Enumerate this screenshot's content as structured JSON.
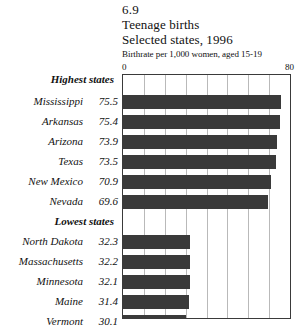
{
  "figure": {
    "number": "6.9",
    "title_line1": "Teenage births",
    "title_line2": "Selected states, 1996",
    "units_note": "Birthrate per 1,000 women, aged 15-19",
    "axis_min_label": "0",
    "axis_max_label": "80",
    "bar_color": "#3a3a3a",
    "gridline_color": "#b9b9b9",
    "frame_color": "#3a3a3a",
    "background_color": "#ffffff"
  },
  "groups": [
    {
      "heading": "Highest states"
    },
    {
      "heading": "Lowest states"
    }
  ],
  "chart_data": {
    "type": "bar",
    "orientation": "horizontal",
    "title": "Teenage births",
    "subtitle": "Selected states, 1996",
    "figure_number": "6.9",
    "xlabel": "Birthrate per 1,000 women, aged 15-19",
    "ylabel": "",
    "xlim": [
      0,
      80
    ],
    "xticks": [
      0,
      10,
      20,
      30,
      40,
      50,
      60,
      70,
      80
    ],
    "xtick_labels": [
      "0",
      "",
      "",
      "",
      "",
      "",
      "",
      "",
      "80"
    ],
    "grid": true,
    "grid_axis": "x",
    "legend": false,
    "categories": [
      "Mississippi",
      "Arkansas",
      "Arizona",
      "Texas",
      "New Mexico",
      "Nevada",
      "North Dakota",
      "Massachusetts",
      "Minnesota",
      "Maine",
      "Vermont",
      "New Hampshire"
    ],
    "values": [
      75.5,
      75.4,
      73.9,
      73.5,
      70.9,
      69.6,
      32.3,
      32.2,
      32.1,
      31.4,
      30.1,
      28.6
    ],
    "series": [
      {
        "name": "Birthrate per 1,000 women aged 15-19",
        "values": [
          75.5,
          75.4,
          73.9,
          73.5,
          70.9,
          69.6,
          32.3,
          32.2,
          32.1,
          31.4,
          30.1,
          28.6
        ]
      }
    ],
    "groups": [
      {
        "heading": "Highest states",
        "items": [
          {
            "label": "Mississippi",
            "value": 75.5,
            "value_text": "75.5"
          },
          {
            "label": "Arkansas",
            "value": 75.4,
            "value_text": "75.4"
          },
          {
            "label": "Arizona",
            "value": 73.9,
            "value_text": "73.9"
          },
          {
            "label": "Texas",
            "value": 73.5,
            "value_text": "73.5"
          },
          {
            "label": "New Mexico",
            "value": 70.9,
            "value_text": "70.9"
          },
          {
            "label": "Nevada",
            "value": 69.6,
            "value_text": "69.6"
          }
        ]
      },
      {
        "heading": "Lowest states",
        "items": [
          {
            "label": "North Dakota",
            "value": 32.3,
            "value_text": "32.3"
          },
          {
            "label": "Massachusetts",
            "value": 32.2,
            "value_text": "32.2"
          },
          {
            "label": "Minnesota",
            "value": 32.1,
            "value_text": "32.1"
          },
          {
            "label": "Maine",
            "value": 31.4,
            "value_text": "31.4"
          },
          {
            "label": "Vermont",
            "value": 30.1,
            "value_text": "30.1"
          },
          {
            "label": "New Hampshire",
            "value": 28.6,
            "value_text": "28.6"
          }
        ]
      }
    ]
  }
}
